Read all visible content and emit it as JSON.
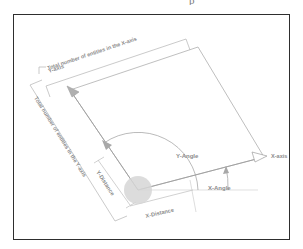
{
  "figure": {
    "type": "technical-diagram",
    "frame": {
      "border_color": "#2e2e2e",
      "background": "#ffffff"
    },
    "line_color": "#a8a8a8",
    "label_color": "#8c8c8c",
    "origin_marker_color": "#cfcfcf"
  },
  "labels": {
    "total_x_entities": "Total number of entities in the X-axis",
    "total_y_entities": "Total number of entities in the Y-axis",
    "y_axis": "Y-axis",
    "x_axis": "X-axis",
    "y_angle": "Y-Angle",
    "x_angle": "X-Angle",
    "y_distance": "Y-Distance",
    "x_distance": "X-Distance"
  },
  "geometry": {
    "origin": {
      "x": 138,
      "y": 190
    },
    "origin_circle_radius": 14,
    "x_axis_arrow_tip": {
      "x": 266,
      "y": 156
    },
    "y_axis_arrow_tip": {
      "x": 67,
      "y": 87
    },
    "rect_corners": [
      {
        "x": 138,
        "y": 190
      },
      {
        "x": 70,
        "y": 90
      },
      {
        "x": 198,
        "y": 47
      },
      {
        "x": 264,
        "y": 157
      }
    ],
    "x_angle_degrees": 15,
    "y_angle_degrees": 124
  },
  "top_artifact": "p"
}
